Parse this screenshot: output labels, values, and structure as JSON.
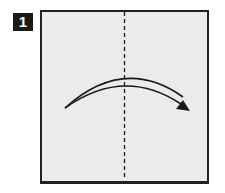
{
  "diagram": {
    "type": "origami-instruction-step",
    "step": {
      "number": "1"
    },
    "paper": {
      "color": "#ebebeb",
      "border_color": "#222222"
    },
    "fold_line": {
      "kind": "valley-fold",
      "style": "dashed",
      "orientation": "vertical",
      "position": "center"
    },
    "arrow": {
      "direction": "left-to-right",
      "meaning": "fold left half over to the right",
      "color": "#1a1a1a"
    }
  }
}
